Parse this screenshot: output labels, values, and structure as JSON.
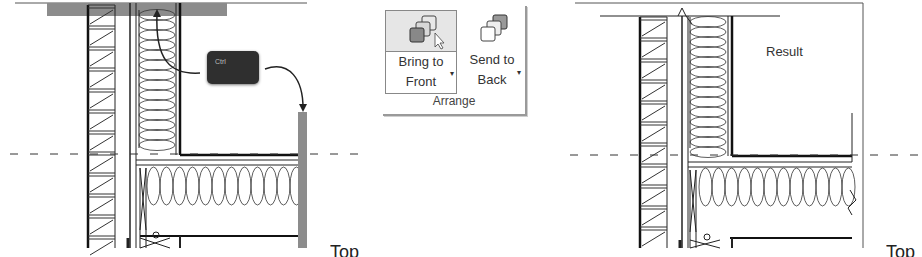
{
  "ribbon": {
    "group_label": "Arrange",
    "buttons": [
      {
        "line1": "Bring to",
        "line2": "Front",
        "icon": "bring-to-front-icon",
        "state": "hovered"
      },
      {
        "line1": "Send to",
        "line2": "Back",
        "icon": "send-to-back-icon",
        "state": "normal"
      }
    ],
    "dropdown_glyph": "▾"
  },
  "left_drawing": {
    "key_label": "Ctrl",
    "cut_text": "Top"
  },
  "right_drawing": {
    "result_label": "Result",
    "cut_text": "Top"
  },
  "colors": {
    "highlight_gray": "#8c8c8c",
    "line": "#1a1a1a",
    "key_bg": "#2f2f2f",
    "button_hover_bg": "#e6e6e6"
  }
}
